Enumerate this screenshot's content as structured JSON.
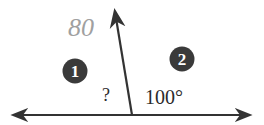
{
  "diagram": {
    "type": "angle-pair",
    "colors": {
      "line": "#333333",
      "badge": "#3a3a3a",
      "badge_text": "#ffffff",
      "handwriting": "#9a9a9a"
    },
    "badges": [
      {
        "label": "1",
        "region": "left"
      },
      {
        "label": "2",
        "region": "right"
      }
    ],
    "angles": {
      "left": "?",
      "right": "100°"
    },
    "handwritten_note": "80"
  }
}
